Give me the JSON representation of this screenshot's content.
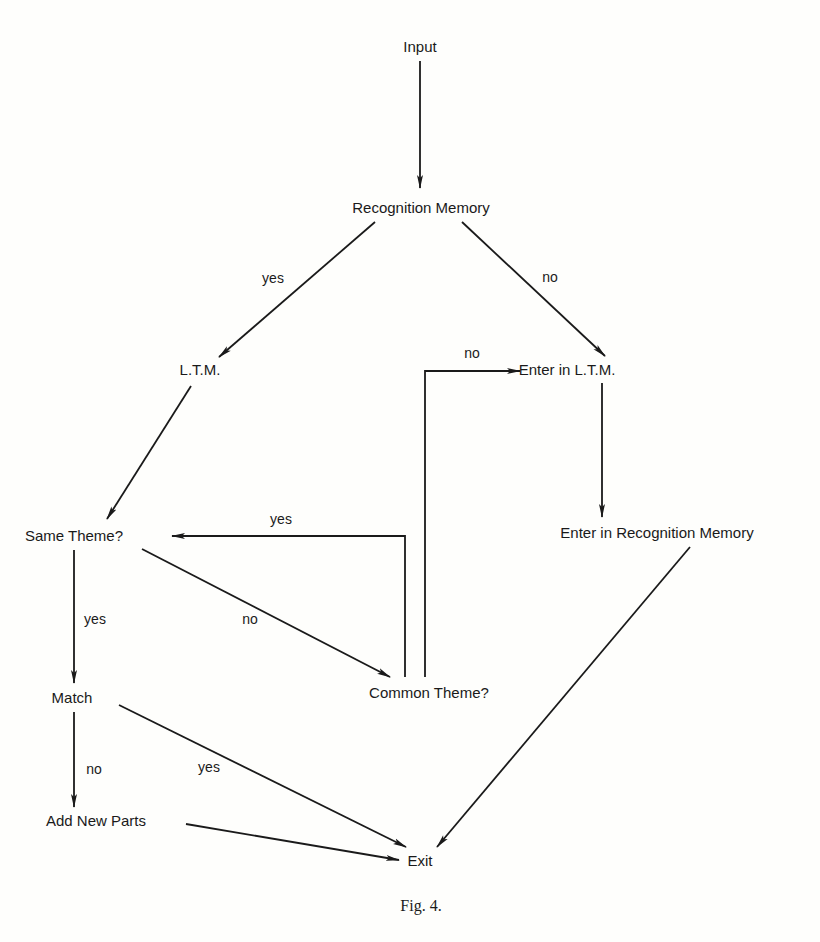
{
  "figure": {
    "caption": "Fig. 4.",
    "line_color": "#1a1a1a",
    "background": "#fefefc"
  },
  "nodes": {
    "input": "Input",
    "recognition_memory": "Recognition Memory",
    "ltm": "L.T.M.",
    "enter_ltm": "Enter in L.T.M.",
    "same_theme": "Same Theme?",
    "enter_recognition_memory": "Enter in Recognition Memory",
    "match": "Match",
    "common_theme": "Common Theme?",
    "add_new_parts": "Add New Parts",
    "exit": "Exit"
  },
  "edges": [
    {
      "from": "Input",
      "to": "Recognition Memory",
      "label": ""
    },
    {
      "from": "Recognition Memory",
      "to": "L.T.M.",
      "label": "yes"
    },
    {
      "from": "Recognition Memory",
      "to": "Enter in L.T.M.",
      "label": "no"
    },
    {
      "from": "L.T.M.",
      "to": "Same Theme?",
      "label": ""
    },
    {
      "from": "Same Theme?",
      "to": "Match",
      "label": "yes"
    },
    {
      "from": "Same Theme?",
      "to": "Common Theme?",
      "label": "no"
    },
    {
      "from": "Common Theme?",
      "to": "Same Theme?",
      "label": "yes"
    },
    {
      "from": "Common Theme?",
      "to": "Enter in L.T.M.",
      "label": "no"
    },
    {
      "from": "Enter in L.T.M.",
      "to": "Enter in Recognition Memory",
      "label": ""
    },
    {
      "from": "Enter in Recognition Memory",
      "to": "Exit",
      "label": ""
    },
    {
      "from": "Match",
      "to": "Exit",
      "label": "yes"
    },
    {
      "from": "Match",
      "to": "Add New Parts",
      "label": "no"
    },
    {
      "from": "Add New Parts",
      "to": "Exit",
      "label": ""
    }
  ],
  "labels": {
    "rm_yes": "yes",
    "rm_no": "no",
    "ct_no": "no",
    "ct_yes": "yes",
    "st_no": "no",
    "st_yes": "yes",
    "match_no": "no",
    "match_yes": "yes"
  }
}
